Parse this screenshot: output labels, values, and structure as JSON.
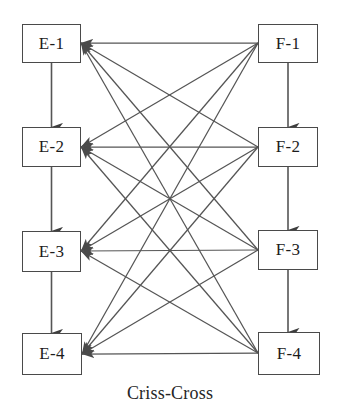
{
  "diagram": {
    "title": "Criss-Cross",
    "type": "bipartite-crisscross-graph",
    "style": {
      "background": "#ffffff",
      "box_stroke": "#4a4a4a",
      "edge_stroke": "#555555",
      "text_color": "#1c1c1c"
    },
    "left_column": {
      "name": "E-column",
      "nodes": [
        {
          "id": "E-1",
          "label": "E-1",
          "x": 22,
          "y": 24,
          "w": 59,
          "h": 39
        },
        {
          "id": "E-2",
          "label": "E-2",
          "x": 22,
          "y": 127,
          "w": 59,
          "h": 40
        },
        {
          "id": "E-3",
          "label": "E-3",
          "x": 22,
          "y": 231,
          "w": 59,
          "h": 41
        },
        {
          "id": "E-4",
          "label": "E-4",
          "x": 22,
          "y": 333,
          "w": 60,
          "h": 42
        }
      ]
    },
    "right_column": {
      "name": "F-column",
      "nodes": [
        {
          "id": "F-1",
          "label": "F-1",
          "x": 258,
          "y": 24,
          "w": 60,
          "h": 39
        },
        {
          "id": "F-2",
          "label": "F-2",
          "x": 258,
          "y": 127,
          "w": 60,
          "h": 40
        },
        {
          "id": "F-3",
          "label": "F-3",
          "x": 258,
          "y": 230,
          "w": 60,
          "h": 40
        },
        {
          "id": "F-4",
          "label": "F-4",
          "x": 258,
          "y": 332,
          "w": 62,
          "h": 43
        }
      ]
    },
    "vertical_edges": [
      {
        "from": "E-1",
        "to": "E-2",
        "direction": "down",
        "arrowhead": true
      },
      {
        "from": "E-2",
        "to": "E-3",
        "direction": "down",
        "arrowhead": true
      },
      {
        "from": "E-3",
        "to": "E-4",
        "direction": "down",
        "arrowhead": true
      },
      {
        "from": "F-1",
        "to": "F-2",
        "direction": "down",
        "arrowhead": true
      },
      {
        "from": "F-2",
        "to": "F-3",
        "direction": "down",
        "arrowhead": true
      },
      {
        "from": "F-3",
        "to": "F-4",
        "direction": "down",
        "arrowhead": true
      }
    ],
    "cross_edges": [
      {
        "from": "F-1",
        "to": "E-1",
        "arrowhead": true
      },
      {
        "from": "F-1",
        "to": "E-2",
        "arrowhead": true
      },
      {
        "from": "F-1",
        "to": "E-3",
        "arrowhead": true
      },
      {
        "from": "F-1",
        "to": "E-4",
        "arrowhead": true
      },
      {
        "from": "F-2",
        "to": "E-1",
        "arrowhead": true
      },
      {
        "from": "F-2",
        "to": "E-2",
        "arrowhead": true
      },
      {
        "from": "F-2",
        "to": "E-3",
        "arrowhead": true
      },
      {
        "from": "F-2",
        "to": "E-4",
        "arrowhead": true
      },
      {
        "from": "F-3",
        "to": "E-1",
        "arrowhead": true
      },
      {
        "from": "F-3",
        "to": "E-2",
        "arrowhead": true
      },
      {
        "from": "F-3",
        "to": "E-3",
        "arrowhead": true
      },
      {
        "from": "F-3",
        "to": "E-4",
        "arrowhead": true
      },
      {
        "from": "F-4",
        "to": "E-1",
        "arrowhead": true
      },
      {
        "from": "F-4",
        "to": "E-2",
        "arrowhead": true
      },
      {
        "from": "F-4",
        "to": "E-3",
        "arrowhead": true
      },
      {
        "from": "F-4",
        "to": "E-4",
        "arrowhead": true
      }
    ]
  }
}
